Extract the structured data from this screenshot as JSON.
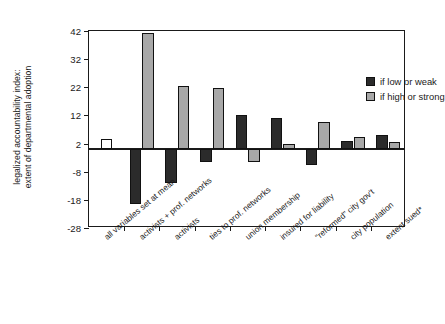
{
  "chart_data": {
    "type": "bar",
    "title": "",
    "subtitle": "",
    "xlabel": "",
    "ylabel_line1": "legalized accountability index:",
    "ylabel_line2": "extent of departmental adoption",
    "ylim": [
      -28,
      42
    ],
    "yticks": [
      42,
      32,
      22,
      12,
      2,
      -8,
      -18,
      -28
    ],
    "ytick_labels": [
      "42",
      "32",
      "22",
      "12",
      "2",
      "-8",
      "-18",
      "-28"
    ],
    "grid": false,
    "zero_reference_line": 0,
    "legend_position": "top-right",
    "categories": [
      "all variables set at mean",
      "activists + prof. networks",
      "activists",
      "ties to prof. networks",
      "union membership",
      "insured for liability",
      "\"reformed\" city gov't",
      "city population",
      "extent sued*"
    ],
    "series": [
      {
        "name": "if low or weak",
        "color": "#2b2b2b",
        "values": [
          null,
          -19.5,
          -12.0,
          -4.5,
          12.0,
          11.0,
          -5.5,
          3.0,
          5.0
        ]
      },
      {
        "name": "if high or strong",
        "color": "#a8a8a8",
        "values": [
          null,
          41.3,
          22.5,
          21.8,
          -4.5,
          2.0,
          9.5,
          4.5,
          2.5
        ]
      },
      {
        "name": "baseline (all variables at mean)",
        "color": "#ffffff",
        "values": [
          3.5,
          null,
          null,
          null,
          null,
          null,
          null,
          null,
          null
        ]
      }
    ],
    "legend": [
      {
        "label": "if low or weak",
        "swatch": "dark"
      },
      {
        "label": "if high or strong",
        "swatch": "gray"
      }
    ]
  }
}
